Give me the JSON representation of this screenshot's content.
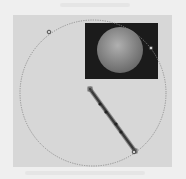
{
  "diagram": {
    "background_color": "#efefef",
    "panel_color": "#d7d7d7",
    "circle": {
      "cx": 93,
      "cy": 93,
      "r": 73,
      "stroke": "#8a8a8a",
      "style": "dotted"
    },
    "inset": {
      "x": 85,
      "y": 23,
      "width": 73,
      "height": 56,
      "fill": "#1b1b1b",
      "sphere": {
        "cx": 120,
        "cy": 50,
        "r": 23,
        "fill_light": "#a8a8a8",
        "fill_dark": "#6d6d6d"
      }
    },
    "handles": [
      {
        "x": 49,
        "y": 32
      },
      {
        "x": 151,
        "y": 48
      },
      {
        "x": 134,
        "y": 152
      }
    ],
    "rod": {
      "x1": 90,
      "y1": 89,
      "x2": 135,
      "y2": 151,
      "color": "#3a3a3a",
      "markers": [
        {
          "x": 100,
          "y": 104
        },
        {
          "x": 106,
          "y": 112
        },
        {
          "x": 116,
          "y": 124
        },
        {
          "x": 121,
          "y": 132
        }
      ]
    }
  }
}
